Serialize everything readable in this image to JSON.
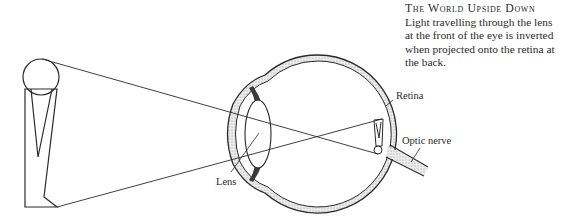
{
  "caption": {
    "title": "The World Upside Down",
    "lines": [
      "Light travelling through the lens",
      "at the front of the eye is inverted",
      "when projected onto the retina at",
      "the back."
    ]
  },
  "labels": {
    "retina": "Retina",
    "optic_nerve": "Optic nerve",
    "lens": "Lens"
  },
  "colors": {
    "ink": "#2a2a2a",
    "stipple": "#cfcfcf",
    "muscle": "#3a3a3a"
  }
}
